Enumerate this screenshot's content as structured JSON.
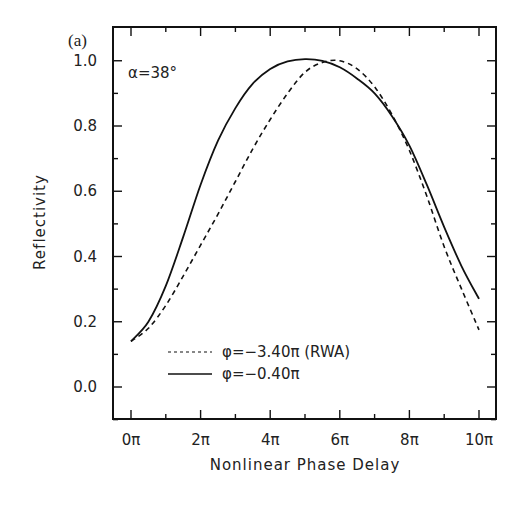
{
  "chart_data": {
    "type": "line",
    "panel_label": "(a)",
    "annotation": "α=38°",
    "title": "",
    "xlabel": "Nonlinear Phase Delay",
    "ylabel": "Reflectivity",
    "xlim": [
      0,
      10
    ],
    "ylim": [
      -0.1,
      1.1
    ],
    "x_unit": "π",
    "x_ticks": [
      0,
      2,
      4,
      6,
      8,
      10
    ],
    "x_tick_labels": [
      "0π",
      "2π",
      "4π",
      "6π",
      "8π",
      "10π"
    ],
    "x_minor_ticks": [
      1,
      3,
      5,
      7,
      9
    ],
    "y_ticks": [
      0.0,
      0.2,
      0.4,
      0.6,
      0.8,
      1.0
    ],
    "y_tick_labels": [
      "0.0",
      "0.2",
      "0.4",
      "0.6",
      "0.8",
      "1.0"
    ],
    "y_minor_ticks": [
      -0.1,
      0.1,
      0.3,
      0.5,
      0.7,
      0.9
    ],
    "grid": false,
    "legend_position": "lower center",
    "x": [
      0,
      0.5,
      1,
      1.5,
      2,
      2.5,
      3,
      3.5,
      4,
      4.5,
      5,
      5.5,
      6,
      6.5,
      7,
      7.5,
      8,
      8.5,
      9,
      9.5,
      10
    ],
    "series": [
      {
        "name": "φ=−3.40π (RWA)",
        "style": "dashed",
        "values": [
          0.14,
          0.18,
          0.25,
          0.34,
          0.435,
          0.53,
          0.63,
          0.73,
          0.82,
          0.9,
          0.965,
          0.995,
          1.0,
          0.975,
          0.92,
          0.835,
          0.725,
          0.585,
          0.43,
          0.3,
          0.175
        ]
      },
      {
        "name": "φ=−0.40π",
        "style": "solid",
        "values": [
          0.14,
          0.2,
          0.31,
          0.46,
          0.62,
          0.755,
          0.855,
          0.93,
          0.975,
          0.998,
          1.005,
          1.0,
          0.98,
          0.945,
          0.9,
          0.83,
          0.74,
          0.62,
          0.49,
          0.37,
          0.27
        ]
      }
    ]
  }
}
